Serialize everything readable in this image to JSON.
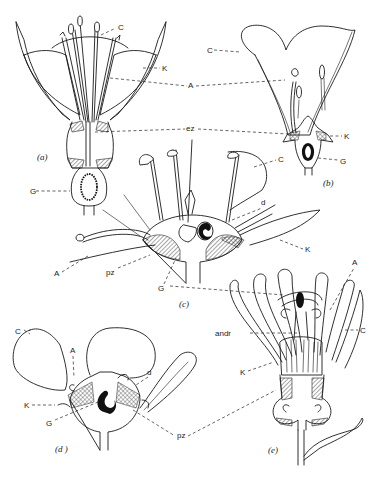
{
  "figure": {
    "panels": [
      {
        "id": "a",
        "caption": "(a)",
        "labels": {
          "C": "C",
          "K": "K",
          "G": "G"
        }
      },
      {
        "id": "b",
        "caption": "(b)",
        "labels": {
          "C": "C",
          "K": "K",
          "G": "G"
        }
      },
      {
        "id": "c",
        "caption": "(c)",
        "labels": {
          "C": "C",
          "d": "d",
          "K": "K",
          "A": "A",
          "pz": "pz",
          "G": "G"
        }
      },
      {
        "id": "d",
        "caption": "(d )",
        "labels": {
          "C": "C",
          "A": "A",
          "d": "d",
          "K": "K",
          "G": "G"
        }
      },
      {
        "id": "e",
        "caption": "(e)",
        "labels": {
          "A": "A",
          "C": "C",
          "andr": "andr",
          "K": "K"
        }
      }
    ],
    "shared_labels": {
      "A": "A",
      "ez": "ez",
      "pz": "pz"
    }
  }
}
